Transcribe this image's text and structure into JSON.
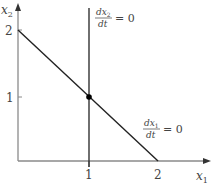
{
  "diagram": {
    "type": "phase-plane-nullclines",
    "axes": {
      "x_label": "x",
      "x_label_sub": "1",
      "y_label": "x",
      "y_label_sub": "2",
      "x_ticks": [
        "1",
        "2"
      ],
      "y_ticks": [
        "1",
        "2"
      ]
    },
    "nullclines": [
      {
        "name": "dx2/dt = 0",
        "kind": "vertical line",
        "at_x1": 1,
        "label_num": "dx",
        "label_num_sub": "2",
        "label_den": "dt",
        "label_rhs": "= 0"
      },
      {
        "name": "dx1/dt = 0",
        "kind": "line",
        "from": [
          0,
          2
        ],
        "to": [
          2,
          0
        ],
        "label_num": "dx",
        "label_num_sub": "1",
        "label_den": "dt",
        "label_rhs": "= 0"
      }
    ],
    "equilibrium": {
      "x1": 1,
      "x2": 1
    },
    "colors": {
      "axis": "#8a8a8a",
      "line": "#222222",
      "text": "#444444"
    }
  }
}
